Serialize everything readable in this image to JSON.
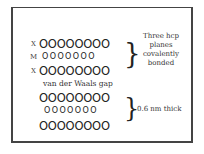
{
  "diagram": {
    "layer1": {
      "rows": [
        {
          "label": "X",
          "atoms": "OOOOOOOO",
          "size": "large"
        },
        {
          "label": "M",
          "atoms": "OOOOOOO",
          "size": "small"
        },
        {
          "label": "X",
          "atoms": "OOOOOOOO",
          "size": "large"
        }
      ],
      "brace": "}",
      "annotation": [
        "Three hcp",
        "planes",
        "covalently",
        "bonded"
      ]
    },
    "gap_label": "van der Waals gap",
    "layer2": {
      "rows": [
        {
          "label": "",
          "atoms": "OOOOOOOO",
          "size": "large"
        },
        {
          "label": "",
          "atoms": "OOOOOOO",
          "size": "small"
        },
        {
          "label": "",
          "atoms": "OOOOOOOO",
          "size": "large"
        }
      ],
      "brace": "}",
      "annotation": "0.6 nm thick"
    }
  }
}
